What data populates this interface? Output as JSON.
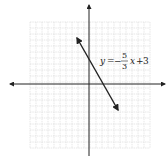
{
  "chart_data": {
    "type": "line",
    "title": "",
    "xlabel": "x",
    "ylabel": "y",
    "grid": true,
    "xlim": [
      -10,
      10
    ],
    "ylim": [
      -10,
      10
    ],
    "annotation": "y = -5/3 x + 3",
    "equation": {
      "lhs": "y",
      "equals": "=",
      "sign": "−",
      "numerator": "5",
      "denominator": "3",
      "var": "x",
      "plus": "+",
      "constant": "3"
    },
    "series": [
      {
        "name": "y = -5/3 x + 3",
        "slope": -1.6667,
        "intercept": 3,
        "x": [
          -2,
          0,
          1.8,
          5
        ],
        "y": [
          6.33,
          3,
          0,
          -5.33
        ]
      }
    ],
    "colors": {
      "grid": "#d0d0d0",
      "axis": "#222222",
      "line": "#222222"
    }
  }
}
